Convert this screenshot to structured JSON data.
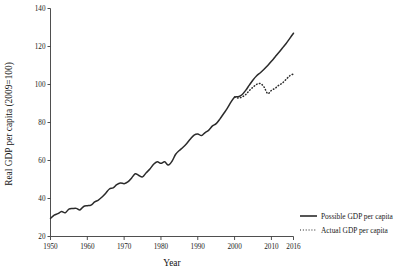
{
  "chart_data": {
    "type": "line",
    "title": "",
    "xlabel": "Year",
    "ylabel": "Real GDP per capita (2009=100)",
    "xlim": [
      1950,
      2016
    ],
    "ylim": [
      20,
      140
    ],
    "grid": false,
    "legend_position": "bottom-right",
    "xticks": [
      1950,
      1960,
      1970,
      1980,
      1990,
      2000,
      2010,
      2016
    ],
    "xticklabels": [
      "1950",
      "1960",
      "1970",
      "1980",
      "1990",
      "2000",
      "2010",
      "2016"
    ],
    "yticks": [
      20,
      40,
      60,
      80,
      100,
      120,
      140
    ],
    "yticklabels": [
      "20",
      "40",
      "60",
      "80",
      "100",
      "120",
      "140"
    ],
    "series": [
      {
        "name": "Possible GDP per capita",
        "style": "solid",
        "color": "#2b2b2b",
        "x": [
          1950,
          1951,
          1952,
          1953,
          1954,
          1955,
          1956,
          1957,
          1958,
          1959,
          1960,
          1961,
          1962,
          1963,
          1964,
          1965,
          1966,
          1967,
          1968,
          1969,
          1970,
          1971,
          1972,
          1973,
          1974,
          1975,
          1976,
          1977,
          1978,
          1979,
          1980,
          1981,
          1982,
          1983,
          1984,
          1985,
          1986,
          1987,
          1988,
          1989,
          1990,
          1991,
          1992,
          1993,
          1994,
          1995,
          1996,
          1997,
          1998,
          1999,
          2000,
          2001,
          2002,
          2003,
          2004,
          2005,
          2006,
          2007,
          2008,
          2009,
          2010,
          2011,
          2012,
          2013,
          2014,
          2015,
          2016
        ],
        "values": [
          29.5,
          31.2,
          32.0,
          33.1,
          32.5,
          34.4,
          34.7,
          34.8,
          34.0,
          35.8,
          36.2,
          36.5,
          38.2,
          39.2,
          40.8,
          42.8,
          45.0,
          45.6,
          47.3,
          48.2,
          47.8,
          48.7,
          50.7,
          53.0,
          52.1,
          51.4,
          53.6,
          55.5,
          58.0,
          59.3,
          58.5,
          59.3,
          57.6,
          59.6,
          63.3,
          65.3,
          67.0,
          69.0,
          71.3,
          73.4,
          74.0,
          73.1,
          74.7,
          76.0,
          78.2,
          79.4,
          81.8,
          84.6,
          87.4,
          90.7,
          93.4,
          93.6,
          94.6,
          96.9,
          99.7,
          102.4,
          104.6,
          106.2,
          108.0,
          110.0,
          112.2,
          114.5,
          116.8,
          119.2,
          121.6,
          124.3,
          127.0
        ]
      },
      {
        "name": "Actual GDP per capita",
        "style": "dotted",
        "color": "#2b2b2b",
        "x": [
          2000,
          2001,
          2002,
          2003,
          2004,
          2005,
          2006,
          2007,
          2008,
          2009,
          2010,
          2011,
          2012,
          2013,
          2014,
          2015,
          2016
        ],
        "values": [
          93.4,
          92.9,
          93.4,
          94.7,
          96.8,
          98.6,
          100.1,
          100.5,
          98.7,
          95.2,
          96.9,
          98.0,
          99.6,
          100.8,
          102.7,
          104.6,
          105.6
        ]
      }
    ],
    "legend": [
      {
        "label": "Possible GDP per capita",
        "style": "solid"
      },
      {
        "label": "Actual GDP per capita",
        "style": "dotted"
      }
    ]
  }
}
